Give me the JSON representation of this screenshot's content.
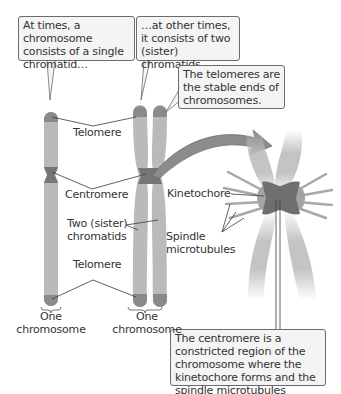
{
  "callouts": {
    "single_chromatid": "At times, a chromosome consists of a single chromatid…",
    "two_chromatids": "…at other times, it consists of two (sister) chromatids.",
    "telomeres": "The telomeres are the stable ends of chromosomes.",
    "centromere": "The centromere is a constricted region of the chromosome where the kinetochore forms and the spindle microtubules attach."
  },
  "labels": {
    "telomere_top": "Telomere",
    "centromere": "Centromere",
    "sister_chromatids_line1": "Two (sister)",
    "sister_chromatids_line2": "chromatids",
    "telomere_bottom": "Telomere",
    "one_chromosome_left_line1": "One",
    "one_chromosome_left_line2": "chromosome",
    "one_chromosome_right_line1": "One",
    "one_chromosome_right_line2": "chromosome",
    "kinetochore": "Kinetochore",
    "spindle_line1": "Spindle",
    "spindle_line2": "microtubules"
  },
  "colors": {
    "chromatid": "#b8b8b8",
    "telomere": "#8a8a8a",
    "centromere": "#6e6e6e",
    "arrow": "#8c8c8c",
    "callout_bg": "#f4f4f4",
    "callout_border": "#6b6b6b"
  }
}
